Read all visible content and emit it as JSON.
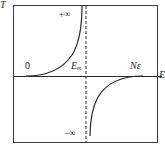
{
  "diagram": {
    "y_axis_label": "T",
    "x_axis_label": "E",
    "labels": {
      "plus_infinity": "+∞",
      "minus_infinity": "−∞",
      "origin": "0",
      "e_m_main": "E",
      "e_m_sub": "m",
      "n_epsilon": "Nε"
    },
    "colors": {
      "line": "#2a2a2a",
      "background": "#ffffff"
    }
  }
}
